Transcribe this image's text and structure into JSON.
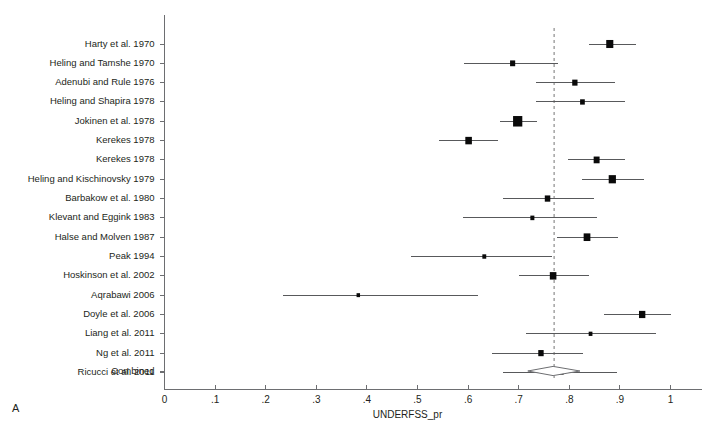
{
  "figure": {
    "panel_letter": "A",
    "axis_title": "UNDERFSS_pr",
    "combined_label": "Combined"
  },
  "chart_data": {
    "type": "forest",
    "title": "",
    "xlabel": "UNDERFSS_pr",
    "ylabel": "",
    "xlim": [
      0,
      1
    ],
    "grid": false,
    "legend": "none",
    "null_line_value": 0.77,
    "tick_labels": [
      "0",
      ".1",
      ".2",
      ".3",
      ".4",
      ".5",
      ".6",
      ".7",
      ".8",
      ".9",
      "1"
    ],
    "tick_values": [
      0,
      0.1,
      0.2,
      0.3,
      0.4,
      0.5,
      0.6,
      0.7,
      0.8,
      0.9,
      1
    ],
    "studies": [
      {
        "label": "Harty et al. 1970",
        "estimate": 0.88,
        "ci_low": 0.838,
        "ci_high": 0.932,
        "weight": 5.0
      },
      {
        "label": "Heling and Tamshe 1970",
        "estimate": 0.688,
        "ci_low": 0.591,
        "ci_high": 0.777,
        "weight": 2.6
      },
      {
        "label": "Adenubi and Rule 1976",
        "estimate": 0.811,
        "ci_low": 0.735,
        "ci_high": 0.891,
        "weight": 2.8
      },
      {
        "label": "Heling and Shapira 1978",
        "estimate": 0.826,
        "ci_low": 0.735,
        "ci_high": 0.911,
        "weight": 2.2
      },
      {
        "label": "Jokinen et al. 1978",
        "estimate": 0.698,
        "ci_low": 0.664,
        "ci_high": 0.737,
        "weight": 8.5
      },
      {
        "label": "Kerekes 1978",
        "estimate": 0.601,
        "ci_low": 0.542,
        "ci_high": 0.66,
        "weight": 4.3
      },
      {
        "label": "Kerekes 1978",
        "estimate": 0.854,
        "ci_low": 0.798,
        "ci_high": 0.911,
        "weight": 3.5
      },
      {
        "label": "Heling and Kischinovsky 1979",
        "estimate": 0.885,
        "ci_low": 0.826,
        "ci_high": 0.947,
        "weight": 5.2
      },
      {
        "label": "Barbakow et al. 1980",
        "estimate": 0.757,
        "ci_low": 0.668,
        "ci_high": 0.848,
        "weight": 3.0
      },
      {
        "label": "Klevant and Eggink 1983",
        "estimate": 0.727,
        "ci_low": 0.589,
        "ci_high": 0.854,
        "weight": 1.6
      },
      {
        "label": "Halse and Molven 1987",
        "estimate": 0.835,
        "ci_low": 0.776,
        "ci_high": 0.896,
        "weight": 4.5
      },
      {
        "label": "Peak 1994",
        "estimate": 0.632,
        "ci_low": 0.488,
        "ci_high": 0.766,
        "weight": 1.5
      },
      {
        "label": "Hoskinson et al. 2002",
        "estimate": 0.768,
        "ci_low": 0.7,
        "ci_high": 0.838,
        "weight": 4.3
      },
      {
        "label": "Aqrabawi 2006",
        "estimate": 0.383,
        "ci_low": 0.235,
        "ci_high": 0.62,
        "weight": 1.2
      },
      {
        "label": "Doyle et al. 2006",
        "estimate": 0.944,
        "ci_low": 0.868,
        "ci_high": 1.0,
        "weight": 4.0
      },
      {
        "label": "Liang et al. 2011",
        "estimate": 0.842,
        "ci_low": 0.715,
        "ci_high": 0.971,
        "weight": 1.4
      },
      {
        "label": "Ng et al. 2011",
        "estimate": 0.744,
        "ci_low": 0.648,
        "ci_high": 0.827,
        "weight": 2.9
      },
      {
        "label": "Ricucci et al. 2011",
        "estimate": 0.785,
        "ci_low": 0.668,
        "ci_high": 0.895,
        "weight": 1.5
      }
    ],
    "combined": {
      "label": "Combined",
      "estimate": 0.768,
      "ci_low": 0.718,
      "ci_high": 0.821
    }
  }
}
